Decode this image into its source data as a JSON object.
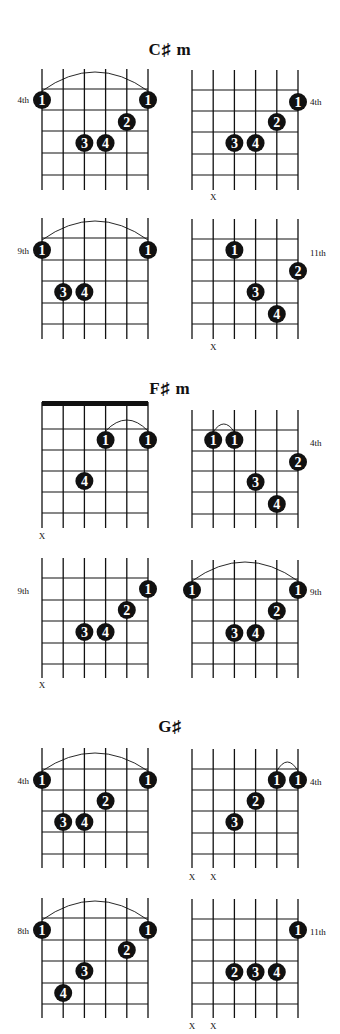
{
  "page": {
    "background": "#ffffff",
    "ink": "#111111"
  },
  "sections": [
    {
      "title": "C♯ m",
      "title_y": 50,
      "diagrams": [
        {
          "x": 42,
          "y": 69,
          "fret_lines": [
            89,
            110,
            131,
            153,
            175
          ],
          "bottom": 190,
          "position_label": {
            "text": "4th",
            "side": "left",
            "y": 100
          },
          "barre_arc": {
            "from_string": 1,
            "to_string": 6,
            "peak_y": 72,
            "base_y": 91
          },
          "dots": [
            {
              "string": 1,
              "y": 100,
              "finger": "1"
            },
            {
              "string": 6,
              "y": 100,
              "finger": "1"
            },
            {
              "string": 5,
              "y": 122,
              "finger": "2"
            },
            {
              "string": 3,
              "y": 143,
              "finger": "3"
            },
            {
              "string": 4,
              "y": 143,
              "finger": "4"
            }
          ],
          "muted": [],
          "muted_y": 0
        },
        {
          "x": 192,
          "y": 70,
          "fret_lines": [
            90,
            111,
            132,
            154,
            175
          ],
          "bottom": 190,
          "position_label": {
            "text": "4th",
            "side": "right",
            "y": 102
          },
          "dots": [
            {
              "string": 6,
              "y": 102,
              "finger": "1"
            },
            {
              "string": 5,
              "y": 122,
              "finger": "2"
            },
            {
              "string": 3,
              "y": 143,
              "finger": "3"
            },
            {
              "string": 4,
              "y": 143,
              "finger": "4"
            }
          ],
          "muted": [
            2
          ],
          "muted_y": 197
        },
        {
          "x": 42,
          "y": 218,
          "fret_lines": [
            238,
            260,
            281,
            303,
            324
          ],
          "bottom": 339,
          "position_label": {
            "text": "9th",
            "side": "left",
            "y": 251
          },
          "barre_arc": {
            "from_string": 1,
            "to_string": 6,
            "peak_y": 221,
            "base_y": 240
          },
          "dots": [
            {
              "string": 1,
              "y": 250,
              "finger": "1"
            },
            {
              "string": 6,
              "y": 250,
              "finger": "1"
            },
            {
              "string": 2,
              "y": 292,
              "finger": "3"
            },
            {
              "string": 3,
              "y": 292,
              "finger": "4"
            }
          ],
          "muted": [],
          "muted_y": 0
        },
        {
          "x": 192,
          "y": 219,
          "fret_lines": [
            239,
            260,
            281,
            303,
            324
          ],
          "bottom": 339,
          "position_label": {
            "text": "11th",
            "side": "right",
            "y": 253
          },
          "dots": [
            {
              "string": 3,
              "y": 250,
              "finger": "1"
            },
            {
              "string": 6,
              "y": 271,
              "finger": "2"
            },
            {
              "string": 4,
              "y": 292,
              "finger": "3"
            },
            {
              "string": 5,
              "y": 314,
              "finger": "4"
            }
          ],
          "muted": [
            2
          ],
          "muted_y": 347
        }
      ]
    },
    {
      "title": "F♯ m",
      "title_y": 389,
      "diagrams": [
        {
          "x": 42,
          "y": 402,
          "fret_lines": [
            429,
            450,
            471,
            492,
            513
          ],
          "bottom": 528,
          "nut": true,
          "dots": [
            {
              "string": 4,
              "y": 440,
              "finger": "1"
            },
            {
              "string": 6,
              "y": 440,
              "finger": "1"
            },
            {
              "string": 3,
              "y": 481,
              "finger": "4"
            }
          ],
          "barre_arc": {
            "from_string": 4,
            "to_string": 6,
            "peak_y": 420,
            "base_y": 431
          },
          "muted": [
            1
          ],
          "muted_y": 536
        },
        {
          "x": 192,
          "y": 410,
          "fret_lines": [
            430,
            451,
            471,
            492,
            514
          ],
          "bottom": 528,
          "position_label": {
            "text": "4th",
            "side": "right",
            "y": 443
          },
          "barre_arc": {
            "from_string": 2,
            "to_string": 3,
            "peak_y": 424,
            "base_y": 432
          },
          "dots": [
            {
              "string": 2,
              "y": 440,
              "finger": "1"
            },
            {
              "string": 3,
              "y": 440,
              "finger": "1"
            },
            {
              "string": 6,
              "y": 462,
              "finger": "2"
            },
            {
              "string": 4,
              "y": 482,
              "finger": "3"
            },
            {
              "string": 5,
              "y": 504,
              "finger": "4"
            }
          ],
          "muted": [],
          "muted_y": 0
        },
        {
          "x": 42,
          "y": 558,
          "fret_lines": [
            578,
            600,
            621,
            643,
            664
          ],
          "bottom": 678,
          "position_label": {
            "text": "9th",
            "side": "left",
            "y": 591
          },
          "dots": [
            {
              "string": 6,
              "y": 589,
              "finger": "1"
            },
            {
              "string": 5,
              "y": 610,
              "finger": "2"
            },
            {
              "string": 3,
              "y": 632,
              "finger": "3"
            },
            {
              "string": 4,
              "y": 632,
              "finger": "4"
            }
          ],
          "muted": [
            1
          ],
          "muted_y": 685
        },
        {
          "x": 192,
          "y": 560,
          "fret_lines": [
            579,
            600,
            621,
            643,
            664
          ],
          "bottom": 678,
          "position_label": {
            "text": "9th",
            "side": "right",
            "y": 592
          },
          "barre_arc": {
            "from_string": 1,
            "to_string": 6,
            "peak_y": 562,
            "base_y": 581
          },
          "dots": [
            {
              "string": 1,
              "y": 590,
              "finger": "1"
            },
            {
              "string": 6,
              "y": 590,
              "finger": "1"
            },
            {
              "string": 5,
              "y": 611,
              "finger": "2"
            },
            {
              "string": 3,
              "y": 633,
              "finger": "3"
            },
            {
              "string": 4,
              "y": 633,
              "finger": "4"
            }
          ],
          "muted": [],
          "muted_y": 0
        }
      ]
    },
    {
      "title": "G♯",
      "title_y": 727,
      "diagrams": [
        {
          "x": 42,
          "y": 748,
          "fret_lines": [
            769,
            790,
            811,
            832,
            854
          ],
          "bottom": 868,
          "position_label": {
            "text": "4th",
            "side": "left",
            "y": 781
          },
          "barre_arc": {
            "from_string": 1,
            "to_string": 6,
            "peak_y": 753,
            "base_y": 771
          },
          "dots": [
            {
              "string": 1,
              "y": 780,
              "finger": "1"
            },
            {
              "string": 6,
              "y": 780,
              "finger": "1"
            },
            {
              "string": 4,
              "y": 801,
              "finger": "2"
            },
            {
              "string": 2,
              "y": 822,
              "finger": "3"
            },
            {
              "string": 3,
              "y": 822,
              "finger": "4"
            }
          ],
          "muted": [],
          "muted_y": 0
        },
        {
          "x": 192,
          "y": 749,
          "fret_lines": [
            769,
            790,
            811,
            833,
            854
          ],
          "bottom": 868,
          "position_label": {
            "text": "4th",
            "side": "right",
            "y": 782
          },
          "barre_arc": {
            "from_string": 5,
            "to_string": 6,
            "peak_y": 762,
            "base_y": 771
          },
          "dots": [
            {
              "string": 5,
              "y": 780,
              "finger": "1"
            },
            {
              "string": 6,
              "y": 780,
              "finger": "1"
            },
            {
              "string": 4,
              "y": 801,
              "finger": "2"
            },
            {
              "string": 3,
              "y": 822,
              "finger": "3"
            }
          ],
          "muted": [
            1,
            2
          ],
          "muted_y": 877
        },
        {
          "x": 42,
          "y": 898,
          "fret_lines": [
            918,
            940,
            961,
            983,
            1004
          ],
          "bottom": 1018,
          "position_label": {
            "text": "8th",
            "side": "left",
            "y": 931
          },
          "barre_arc": {
            "from_string": 1,
            "to_string": 6,
            "peak_y": 901,
            "base_y": 920
          },
          "dots": [
            {
              "string": 1,
              "y": 930,
              "finger": "1"
            },
            {
              "string": 6,
              "y": 930,
              "finger": "1"
            },
            {
              "string": 5,
              "y": 950,
              "finger": "2"
            },
            {
              "string": 3,
              "y": 971,
              "finger": "3"
            },
            {
              "string": 2,
              "y": 993,
              "finger": "4"
            }
          ],
          "muted": [],
          "muted_y": 0
        },
        {
          "x": 192,
          "y": 899,
          "fret_lines": [
            919,
            940,
            961,
            983,
            1004
          ],
          "bottom": 1018,
          "position_label": {
            "text": "11th",
            "side": "right",
            "y": 932
          },
          "dots": [
            {
              "string": 6,
              "y": 930,
              "finger": "1"
            },
            {
              "string": 3,
              "y": 972,
              "finger": "2"
            },
            {
              "string": 4,
              "y": 972,
              "finger": "3"
            },
            {
              "string": 5,
              "y": 972,
              "finger": "4"
            }
          ],
          "muted": [
            1,
            2
          ],
          "muted_y": 1026
        }
      ]
    }
  ],
  "grid": {
    "string_spacing": 21.2,
    "strings": 6,
    "dot_radius": 9
  },
  "muted_symbol": "X"
}
